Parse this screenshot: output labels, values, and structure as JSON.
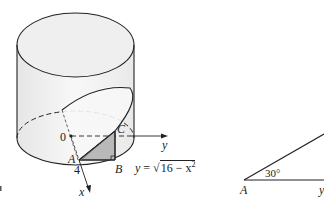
{
  "figure": {
    "left_panel": {
      "description": "Cylinder with wedge cut by plane through diameter",
      "labels": {
        "origin": "0",
        "point_a": "A",
        "point_b": "B",
        "point_c": "C",
        "radius": "4",
        "x_axis": "x",
        "y_axis": "y"
      },
      "equation": {
        "lhs": "y",
        "equals": "=",
        "radicand": "16 − x",
        "exponent": "2"
      },
      "panel_tag": "a"
    },
    "right_panel": {
      "description": "Right triangle cross-section with angle at A",
      "labels": {
        "vertex": "A",
        "angle": "30°",
        "edge_label": "y"
      }
    },
    "colors": {
      "line": "#222222",
      "cylinder_fill": "#f2f2f2",
      "wedge_fill": "#e6e6e6",
      "triangle_fill": "#b8b8b8"
    }
  }
}
